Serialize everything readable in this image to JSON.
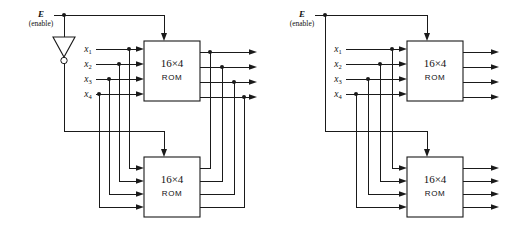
{
  "figure": {
    "background_color": "#ffffff",
    "line_color": "#1a1a1a",
    "width": 512,
    "height": 235
  },
  "diagrams": [
    {
      "id": "left",
      "name": "rom-expansion-with-inverter",
      "enable": {
        "label": "E",
        "sublabel": "(enable)"
      },
      "has_inverter": true,
      "inverter": {
        "name": "inverter-gate",
        "bubble": true
      },
      "inputs": [
        {
          "label": "x",
          "sub": "1"
        },
        {
          "label": "x",
          "sub": "2"
        },
        {
          "label": "x",
          "sub": "3"
        },
        {
          "label": "x",
          "sub": "4"
        }
      ],
      "roms": [
        {
          "size": "16×4",
          "word": "ROM",
          "position": "top"
        },
        {
          "size": "16×4",
          "word": "ROM",
          "position": "bottom"
        }
      ],
      "outputs_count": 4,
      "outputs_wired_together": true
    },
    {
      "id": "right",
      "name": "rom-expansion-shared-enable",
      "enable": {
        "label": "E",
        "sublabel": "(enable)"
      },
      "has_inverter": false,
      "inputs": [
        {
          "label": "x",
          "sub": "1"
        },
        {
          "label": "x",
          "sub": "2"
        },
        {
          "label": "x",
          "sub": "3"
        },
        {
          "label": "x",
          "sub": "4"
        }
      ],
      "roms": [
        {
          "size": "16×4",
          "word": "ROM",
          "position": "top"
        },
        {
          "size": "16×4",
          "word": "ROM",
          "position": "bottom"
        }
      ],
      "outputs_count": 8,
      "outputs_wired_together": false
    }
  ]
}
